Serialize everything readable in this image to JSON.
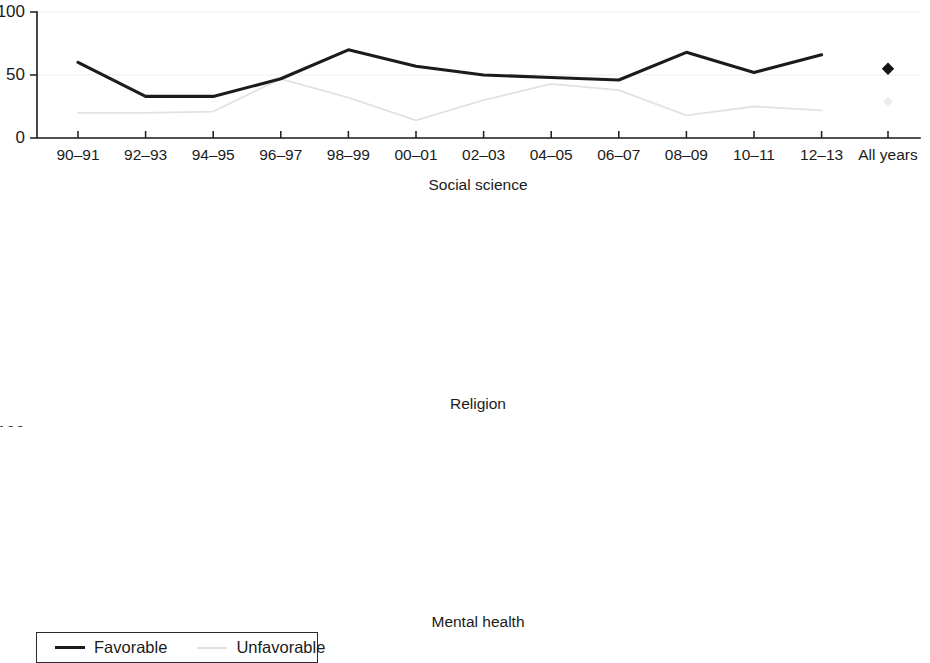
{
  "legend": {
    "entries": [
      {
        "label": "Favorable",
        "key": "favorable",
        "color": "#1b1b1b"
      },
      {
        "label": "Unfavorable",
        "key": "unfavorable",
        "color": "#e0e0e0"
      }
    ]
  },
  "axis": {
    "y_ticks": [
      "0",
      "50",
      "100"
    ],
    "x_ticks": [
      "90–91",
      "92–93",
      "94–95",
      "96–97",
      "98–99",
      "00–01",
      "02–03",
      "04–05",
      "06–07",
      "08–09",
      "10–11",
      "12–13"
    ],
    "summary_tick": "All years"
  },
  "chart_data": [
    {
      "type": "line",
      "title": "Social science",
      "xlabel": "",
      "ylabel": "",
      "ylim": [
        0,
        100
      ],
      "grid": true,
      "legend_position": "bottom-left",
      "categories": [
        "90–91",
        "92–93",
        "94–95",
        "96–97",
        "98–99",
        "00–01",
        "02–03",
        "04–05",
        "06–07",
        "08–09",
        "10–11",
        "12–13"
      ],
      "series": [
        {
          "name": "Favorable",
          "values": [
            60,
            33,
            33,
            47,
            70,
            57,
            50,
            48,
            46,
            68,
            52,
            66
          ],
          "summary": 55
        },
        {
          "name": "Unfavorable",
          "values": [
            20,
            20,
            21,
            47,
            32,
            14,
            30,
            43,
            38,
            18,
            25,
            22
          ],
          "summary": 29
        }
      ]
    },
    {
      "type": "line",
      "title": "Religion",
      "xlabel": "",
      "ylabel": "",
      "ylim": [
        0,
        100
      ],
      "grid": true,
      "legend_position": "bottom-left",
      "categories": [
        "90–91",
        "92–93",
        "94–95",
        "96–97",
        "98–99",
        "00–01",
        "02–03",
        "04–05",
        "06–07",
        "08–09",
        "10–11",
        "12–13"
      ],
      "series": [
        {
          "name": "Favorable",
          "values": [
            100,
            0,
            15,
            0,
            27,
            14,
            29,
            24,
            22,
            22,
            12,
            28
          ],
          "summary": 22
        },
        {
          "name": "Unfavorable",
          "values": [
            0,
            100,
            71,
            88,
            63,
            84,
            68,
            65,
            64,
            82,
            76,
            65
          ],
          "summary": 71
        }
      ]
    },
    {
      "type": "line",
      "title": "Mental health",
      "xlabel": "",
      "ylabel": "",
      "ylim": [
        0,
        100
      ],
      "grid": true,
      "legend_position": "bottom-left",
      "categories": [
        "90–91",
        "92–93",
        "94–95",
        "96–97",
        "98–99",
        "00–01",
        "02–03",
        "04–05",
        "06–07",
        "08–09",
        "10–11",
        "12–13"
      ],
      "series": [
        {
          "name": "Favorable",
          "values": [
            75,
            58,
            50,
            48,
            33,
            28,
            46,
            38,
            40,
            44,
            61,
            69
          ],
          "summary": 48
        },
        {
          "name": "Unfavorable",
          "values": [
            0,
            32,
            40,
            48,
            52,
            53,
            42,
            45,
            55,
            50,
            32,
            24
          ],
          "summary": 44
        }
      ]
    }
  ]
}
